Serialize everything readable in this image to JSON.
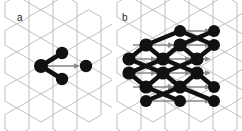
{
  "figure": {
    "background_color": "#ffffff",
    "width": 242,
    "height": 131
  },
  "style": {
    "lattice_line_color": "#b9b9b9",
    "node_color": "#111111",
    "bond_color": "#111111",
    "arrow_color": "#8a8a8a",
    "label_color": "#1a1a1a"
  },
  "panels": [
    {
      "id": "a",
      "label": "a",
      "label_x": 17,
      "label_y": 13,
      "caption": "single three-site motif with hopping arrow",
      "lattice": {
        "hex_width": 24,
        "hex_height": 28,
        "columns": 5,
        "rows": 5
      },
      "nodes": [
        {
          "name": "hub",
          "x": 41,
          "y": 66,
          "r": 6.5
        },
        {
          "name": "upper-right",
          "x": 62,
          "y": 53,
          "r": 6.0
        },
        {
          "name": "lower-right",
          "x": 62,
          "y": 79,
          "r": 6.0
        },
        {
          "name": "target",
          "x": 86,
          "y": 66,
          "r": 6.0
        }
      ],
      "bonds": [
        {
          "from": "hub",
          "to": "upper-right"
        },
        {
          "from": "hub",
          "to": "lower-right"
        }
      ],
      "arrows": [
        {
          "from": "hub",
          "to": "target",
          "x1": 45,
          "y1": 66,
          "x2": 79,
          "y2": 66
        }
      ]
    },
    {
      "id": "b",
      "label": "b",
      "label_x": 10,
      "label_y": 13,
      "caption": "motif tiled into an extended zig-zag network with hopping arrows",
      "lattice": {
        "hex_width": 24,
        "hex_height": 28,
        "columns": 6,
        "rows": 5
      },
      "node_rows": [
        {
          "y": 31,
          "xs": [
            68,
            102
          ]
        },
        {
          "y": 45,
          "xs": [
            34,
            68,
            102
          ]
        },
        {
          "y": 59,
          "xs": [
            17,
            51,
            85
          ]
        },
        {
          "y": 73,
          "xs": [
            17,
            51,
            85
          ]
        },
        {
          "y": 87,
          "xs": [
            34,
            68,
            102
          ]
        },
        {
          "y": 101,
          "xs": [
            34,
            68,
            102
          ]
        }
      ],
      "arrow_rows": [
        {
          "y": 31,
          "x1": 72,
          "x2": 98
        },
        {
          "y": 45,
          "x1": 21,
          "x2": 98
        },
        {
          "y": 59,
          "x1": 21,
          "x2": 98
        },
        {
          "y": 73,
          "x1": 21,
          "x2": 98
        },
        {
          "y": 87,
          "x1": 21,
          "x2": 98
        },
        {
          "y": 101,
          "x1": 38,
          "x2": 98
        }
      ]
    }
  ]
}
